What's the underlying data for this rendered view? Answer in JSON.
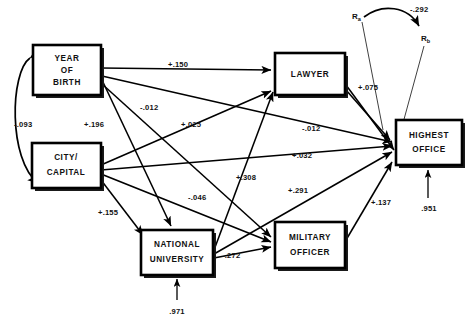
{
  "figure": {
    "type": "path-diagram",
    "top_clipped_caption": "",
    "nodes": [
      {
        "id": "year_of_birth",
        "label_lines": [
          "YEAR",
          "OF",
          "BIRTH"
        ],
        "x": 33,
        "y": 45,
        "w": 68,
        "h": 50
      },
      {
        "id": "city_capital",
        "label_lines": [
          "CITY/",
          "CAPITAL"
        ],
        "x": 32,
        "y": 143,
        "w": 69,
        "h": 45
      },
      {
        "id": "national_university",
        "label_lines": [
          "NATIONAL",
          "UNIVERSITY"
        ],
        "x": 141,
        "y": 230,
        "w": 72,
        "h": 45
      },
      {
        "id": "lawyer",
        "label_lines": [
          "LAWYER"
        ],
        "x": 275,
        "y": 53,
        "w": 70,
        "h": 42
      },
      {
        "id": "military_officer",
        "label_lines": [
          "MILITARY",
          "OFFICER"
        ],
        "x": 275,
        "y": 222,
        "w": 70,
        "h": 46
      },
      {
        "id": "highest_office",
        "label_lines": [
          "HIGHEST",
          "OFFICE"
        ],
        "x": 396,
        "y": 120,
        "w": 66,
        "h": 45
      }
    ],
    "residual_terms": [
      {
        "id": "r_a",
        "label": "R",
        "subscript": "a",
        "x": 355,
        "y": 16
      },
      {
        "id": "r_b",
        "label": "R",
        "subscript": "b",
        "x": 424,
        "y": 38
      }
    ],
    "paths": [
      {
        "id": "yob-to-lawyer",
        "from": "year_of_birth",
        "to": "lawyer",
        "coef": "+.150",
        "label_x": 168,
        "label_y": 67
      },
      {
        "id": "yob-to-highoff",
        "from": "year_of_birth",
        "to": "highest_office",
        "coef": "-.012",
        "label_x": 140,
        "label_y": 110
      },
      {
        "id": "yob-to-natuniv",
        "from": "year_of_birth",
        "to": "national_university",
        "coef": "+.196",
        "label_x": 84,
        "label_y": 127
      },
      {
        "id": "yob-to-milit",
        "from": "year_of_birth",
        "to": "military_officer",
        "coef": "+.025",
        "label_x": 181,
        "label_y": 127
      },
      {
        "id": "city-to-lawyer",
        "from": "city_capital",
        "to": "lawyer",
        "coef": "+.308",
        "label_x": 236,
        "label_y": 180
      },
      {
        "id": "city-to-highoff",
        "from": "city_capital",
        "to": "highest_office",
        "coef": "+.032",
        "label_x": 292,
        "label_y": 158
      },
      {
        "id": "city-to-natuniv",
        "from": "city_capital",
        "to": "national_university",
        "coef": "+.155",
        "label_x": 98,
        "label_y": 215
      },
      {
        "id": "city-to-milit",
        "from": "city_capital",
        "to": "military_officer",
        "coef": "-.046",
        "label_x": 188,
        "label_y": 200
      },
      {
        "id": "natuniv-to-lawyer",
        "from": "national_university",
        "to": "lawyer",
        "coef": "",
        "label_x": 0,
        "label_y": 0
      },
      {
        "id": "natuniv-to-milit",
        "from": "national_university",
        "to": "military_officer",
        "coef": "-.272",
        "label_x": 222,
        "label_y": 258
      },
      {
        "id": "natuniv-to-highoff",
        "from": "national_university",
        "to": "highest_office",
        "coef": "+.291",
        "label_x": 288,
        "label_y": 193
      },
      {
        "id": "lawyer-to-highoff",
        "from": "lawyer",
        "to": "highest_office",
        "coef": "+.075",
        "label_x": 358,
        "label_y": 90
      },
      {
        "id": "lawyer-to-milit",
        "from": "lawyer",
        "to": "military_officer",
        "coef": "-.012",
        "label_x": 302,
        "label_y": 131
      },
      {
        "id": "milit-to-highoff",
        "from": "military_officer",
        "to": "highest_office",
        "coef": "+.137",
        "label_x": 371,
        "label_y": 205
      }
    ],
    "correlations": [
      {
        "id": "yob-city-correlation",
        "between": [
          "year_of_birth",
          "city_capital"
        ],
        "coef": "-.093",
        "label_x": 22,
        "label_y": 127
      },
      {
        "id": "ra-rb-correlation",
        "between": [
          "r_a",
          "r_b"
        ],
        "coef": "-.292",
        "label_x": 424,
        "label_y": 10
      }
    ],
    "residual_arrows": [
      {
        "id": "natuniv-residual",
        "target": "national_university",
        "coef": ".971",
        "label_x": 177,
        "label_y": 312
      },
      {
        "id": "highoff-residual",
        "target": "highest_office",
        "coef": ".951",
        "label_x": 428,
        "label_y": 209
      }
    ]
  }
}
